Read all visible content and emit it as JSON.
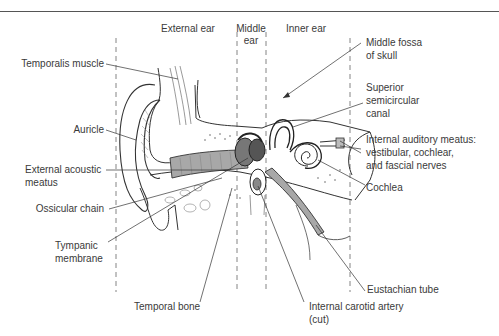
{
  "regions": {
    "external": "External ear",
    "middle_line1": "Middle",
    "middle_line2": "ear",
    "inner": "Inner ear"
  },
  "labels_left": {
    "temporalis": "Temporalis muscle",
    "auricle": "Auricle",
    "eam_line1": "External acoustic",
    "eam_line2": "meatus",
    "ossicular": "Ossicular chain",
    "tympanic_line1": "Tympanic",
    "tympanic_line2": "membrane"
  },
  "labels_right": {
    "fossa_line1": "Middle fossa",
    "fossa_line2": "of skull",
    "canal_line1": "Superior",
    "canal_line2": "semicircular",
    "canal_line3": "canal",
    "iam_line1": "Internal auditory meatus:",
    "iam_line2": "vestibular, cochlear,",
    "iam_line3": "and fascial nerves",
    "cochlea": "Cochlea",
    "eustachian": "Eustachian tube"
  },
  "labels_bottom": {
    "temporal_bone": "Temporal bone",
    "carotid_line1": "Internal carotid artery",
    "carotid_line2": "(cut)"
  },
  "colors": {
    "ink": "#333333",
    "shade": "#9a9a9a",
    "rule": "#555555"
  }
}
